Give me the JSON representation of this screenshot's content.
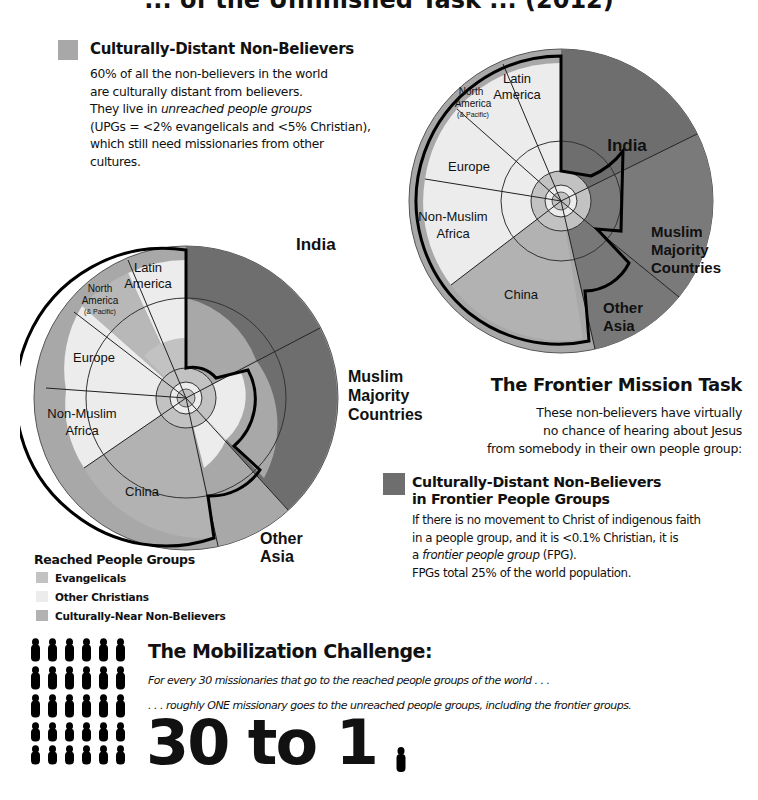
{
  "header": {
    "title_fragment": "... of the Unfinished Task ... (2012)"
  },
  "legend_distant": {
    "title": "Culturally-Distant Non-Believers",
    "color": "#a8a8a8",
    "lines": [
      "60% of all the non-believers in the world",
      "are culturally distant from believers.",
      "They live in ",
      "unreached people groups",
      "(UPGs = <2% evangelicals and <5% Christian),",
      "which still need missionaries from other",
      "cultures."
    ]
  },
  "frontier": {
    "title": "The Frontier Mission Task",
    "lines": [
      "These non-believers have virtually",
      "no chance of hearing about Jesus",
      "from somebody in their own people group:"
    ]
  },
  "fpg_legend": {
    "title_line1": "Culturally-Distant Non-Believers",
    "title_line2": "in Frontier People Groups",
    "color": "#6e6e6e",
    "lines": [
      "If there is no movement to Christ of indigenous faith",
      "in a people group, and it is <0.1% Christian, it is",
      "a ",
      "frontier people group",
      " (FPG).",
      "FPGs total 25% of the world population."
    ]
  },
  "reached_legend": {
    "title": "Reached People Groups",
    "items": [
      {
        "label": "Evangelicals",
        "color": "#c2c2c2"
      },
      {
        "label": "Other Christians",
        "color": "#ececec"
      },
      {
        "label": "Culturally-Near Non-Believers",
        "color": "#b2b2b2"
      }
    ]
  },
  "mobilization": {
    "title": "The Mobilization Challenge:",
    "line1": "For every 30 missionaries that go to the reached people groups of the world . . .",
    "line2": ". . . roughly ONE missionary goes to the unreached people groups, including the frontier groups.",
    "ratio": "30 to 1",
    "left_count": 30,
    "right_count": 1
  },
  "chart_data": [
    {
      "type": "pie",
      "title": "World population by region with unreached share (large chart, left)",
      "categories": [
        "India",
        "Muslim Majority Countries",
        "Other Asia",
        "China",
        "Non-Muslim Africa",
        "Europe",
        "North America (& Pacific)",
        "Latin America"
      ],
      "values": [
        18,
        22,
        9,
        19,
        11,
        10,
        5,
        6
      ],
      "layers": [
        "Evangelicals",
        "Other Christians",
        "Culturally-Near Non-Believers",
        "Culturally-Distant Non-Believers",
        "Culturally-Distant Non-Believers in Frontier People Groups"
      ],
      "note": "Thick black outline encloses reached people groups; outer radial bands show culturally-distant and frontier non-believers"
    },
    {
      "type": "pie",
      "title": "World population by region (small chart, top right)",
      "categories": [
        "India",
        "Muslim Majority Countries",
        "Other Asia",
        "China",
        "Non-Muslim Africa",
        "Europe",
        "North America (& Pacific)",
        "Latin America"
      ],
      "values": [
        18,
        22,
        9,
        19,
        11,
        10,
        5,
        6
      ]
    }
  ],
  "chart_labels": {
    "india": "India",
    "muslim_1": "Muslim",
    "muslim_2": "Majority",
    "muslim_3": "Countries",
    "other_asia_1": "Other",
    "other_asia_2": "Asia",
    "china": "China",
    "africa_1": "Non-Muslim",
    "africa_2": "Africa",
    "europe": "Europe",
    "na_1": "North",
    "na_2": "America",
    "na_3": "(& Pacific)",
    "latam_1": "Latin",
    "latam_2": "America"
  },
  "colors": {
    "frontier_dark": "#6e6e6e",
    "distant_mid": "#a8a8a8",
    "near": "#b2b2b2",
    "evangelical": "#c2c2c2",
    "other_christian": "#ececec",
    "outline": "#000000"
  }
}
